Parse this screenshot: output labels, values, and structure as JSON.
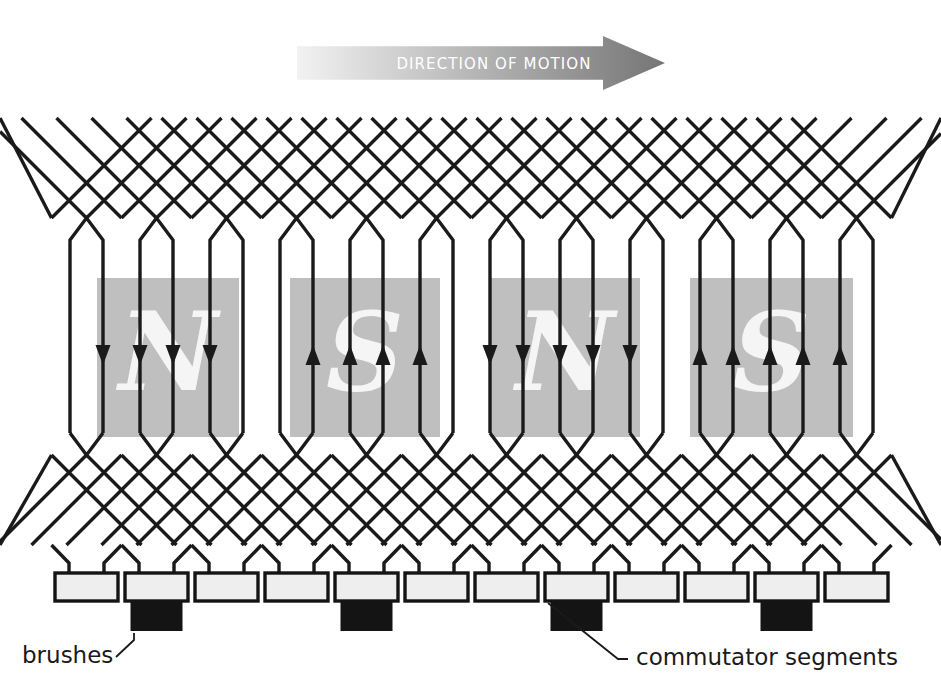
{
  "figure": {
    "background_color": "#ffffff"
  },
  "motion_arrow": {
    "label": "DIRECTION OF MOTION",
    "label_color": "#ffffff",
    "gradient_start": "#f2f2f2",
    "gradient_end": "#757575",
    "direction": "right",
    "x": 297,
    "y": 36,
    "width": 368,
    "height": 54
  },
  "poles": [
    {
      "label": "N",
      "polarity": "north",
      "x": 97,
      "y": 278,
      "width": 142,
      "height": 159,
      "current_direction": "down"
    },
    {
      "label": "S",
      "polarity": "south",
      "x": 290,
      "y": 278,
      "width": 150,
      "height": 159,
      "current_direction": "up"
    },
    {
      "label": "N",
      "polarity": "north",
      "x": 490,
      "y": 278,
      "width": 150,
      "height": 159,
      "current_direction": "down"
    },
    {
      "label": "S",
      "polarity": "south",
      "x": 690,
      "y": 278,
      "width": 163,
      "height": 159,
      "current_direction": "up"
    }
  ],
  "pole_style": {
    "fill": "#bfbfbf",
    "letter_color": "#f5f5f5"
  },
  "conductor_style": {
    "color": "#1a1a1a",
    "line_width": 3.4
  },
  "commutator": {
    "label": "commutator segments",
    "label_x": 636,
    "label_y": 665,
    "segment_count": 12,
    "segment_fill": "#eeeeee",
    "segment_stroke": "#141414",
    "segment_width": 63,
    "segment_height": 28,
    "segment_pitch": 70,
    "first_segment_x": 55,
    "segment_y": 573
  },
  "brushes": {
    "label": "brushes",
    "label_x": 22,
    "label_y": 663,
    "fill": "#141414",
    "width": 52,
    "height": 30,
    "on_segment_indices": [
      1,
      4,
      7,
      10
    ]
  },
  "geometry": {
    "coil_count": 12,
    "coil_pitch": 70,
    "leg_gap": 33,
    "first_leg_x": 70,
    "top_peak_y": 218,
    "top_lattice_y": 118,
    "bottom_peak_y": 455,
    "bottom_lattice_y": 545,
    "segment_top_y": 573
  }
}
